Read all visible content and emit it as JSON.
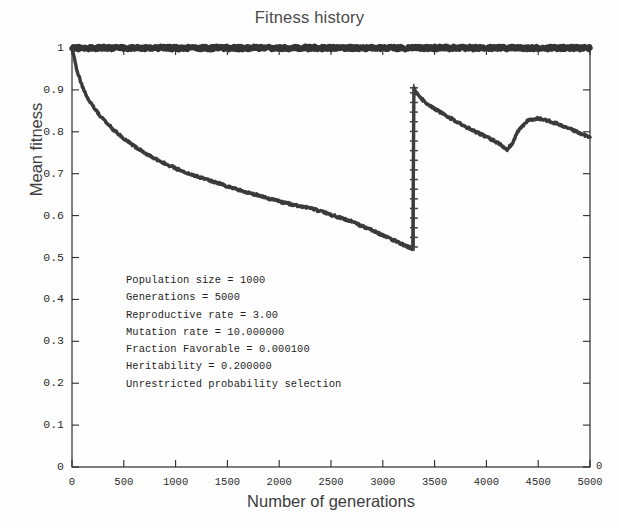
{
  "chart_data": {
    "type": "line",
    "title": "Fitness history",
    "xlabel": "Number of generations",
    "ylabel": "Mean fitness",
    "xlim": [
      0,
      5000
    ],
    "ylim": [
      0,
      1
    ],
    "grid": false,
    "legend_position": "none",
    "x_ticks": [
      0,
      500,
      1000,
      1500,
      2000,
      2500,
      3000,
      3500,
      4000,
      4500,
      5000
    ],
    "x_tick_labels": [
      "0",
      "500",
      "1000",
      "1500",
      "2000",
      "2500",
      "3000",
      "3500",
      "4000",
      "4500",
      "5000"
    ],
    "y_ticks": [
      0,
      0.1,
      0.2,
      0.3,
      0.4,
      0.5,
      0.6,
      0.7,
      0.8,
      0.9,
      1
    ],
    "y_tick_labels": [
      "0",
      "0.1",
      "0.2",
      "0.3",
      "0.4",
      "0.5",
      "0.6",
      "0.7",
      "0.8",
      "0.9",
      "1"
    ],
    "right_axis_tick_labels": [
      "0"
    ],
    "series": [
      {
        "name": "Maximum fitness",
        "marker": "line",
        "color": "#333333",
        "x": [
          0,
          200,
          400,
          700,
          1000,
          1400,
          1800,
          2200,
          2600,
          3000,
          3300,
          3400,
          3800,
          4200,
          4600,
          5000
        ],
        "values": [
          1.0,
          1.0,
          1.0,
          1.0,
          1.0,
          1.0,
          1.0,
          1.0,
          1.0,
          1.0,
          1.0,
          1.0,
          1.0,
          1.0,
          1.0,
          1.0
        ]
      },
      {
        "name": "Mean fitness",
        "marker": "line",
        "color": "#3a3a3a",
        "x": [
          0,
          50,
          100,
          150,
          200,
          250,
          300,
          400,
          500,
          600,
          700,
          800,
          900,
          1000,
          1100,
          1200,
          1300,
          1400,
          1500,
          1600,
          1700,
          1800,
          1900,
          2000,
          2100,
          2200,
          2300,
          2400,
          2500,
          2600,
          2700,
          2800,
          2900,
          3000,
          3100,
          3200,
          3290,
          3300,
          3340,
          3400,
          3500,
          3600,
          3700,
          3800,
          3900,
          4000,
          4100,
          4200,
          4250,
          4300,
          4400,
          4500,
          4600,
          4700,
          4800,
          4900,
          5000
        ],
        "values": [
          1.0,
          0.945,
          0.908,
          0.882,
          0.862,
          0.845,
          0.83,
          0.805,
          0.784,
          0.766,
          0.75,
          0.736,
          0.724,
          0.713,
          0.703,
          0.694,
          0.686,
          0.678,
          0.67,
          0.662,
          0.655,
          0.648,
          0.641,
          0.634,
          0.628,
          0.622,
          0.618,
          0.61,
          0.602,
          0.594,
          0.586,
          0.575,
          0.565,
          0.553,
          0.542,
          0.53,
          0.521,
          0.905,
          0.888,
          0.872,
          0.855,
          0.84,
          0.826,
          0.812,
          0.8,
          0.788,
          0.775,
          0.758,
          0.772,
          0.8,
          0.828,
          0.832,
          0.826,
          0.818,
          0.808,
          0.797,
          0.787
        ]
      },
      {
        "name": "Generation marker",
        "marker": "+",
        "color": "#404040",
        "x": [
          3300,
          3300,
          3300,
          3300,
          3300,
          3300,
          3300,
          3300,
          3300,
          3300,
          3300,
          3300,
          3300,
          3300,
          3300,
          3300,
          3300,
          3300
        ],
        "values": [
          0.525,
          0.548,
          0.571,
          0.594,
          0.617,
          0.64,
          0.663,
          0.686,
          0.709,
          0.732,
          0.755,
          0.778,
          0.801,
          0.824,
          0.847,
          0.87,
          0.893,
          0.905
        ]
      }
    ],
    "annotations": [
      "Population size = 1000",
      "Generations = 5000",
      "Reproductive rate = 3.00",
      "Mutation rate = 10.000000",
      "Fraction Favorable = 0.000100",
      "Heritability = 0.200000",
      "Unrestricted probability selection"
    ]
  },
  "colors": {
    "axis": "#2b2b2b",
    "curve": "#3a3a3a",
    "title_text": "#4a4a4a",
    "background": "#fefefe"
  }
}
